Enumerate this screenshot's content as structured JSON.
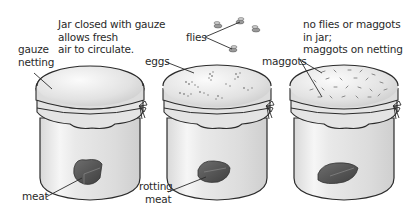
{
  "diagram": {
    "jars": [
      {
        "id": "jar-1",
        "condition": "closed with gauze, fresh meat",
        "description": [
          "Jar closed with gauze",
          "allows fresh",
          "air to circulate."
        ],
        "labels": {
          "lid": [
            "gauze",
            "netting"
          ],
          "contents": [
            "meat"
          ]
        }
      },
      {
        "id": "jar-2",
        "condition": "eggs on gauze, rotting meat",
        "labels": {
          "lid": [
            "eggs"
          ],
          "outside": [
            "flies"
          ],
          "contents": [
            "rotting",
            "meat"
          ]
        }
      },
      {
        "id": "jar-3",
        "condition": "maggots on netting",
        "description": [
          "no flies or maggots",
          "in jar;",
          "maggots on netting"
        ],
        "labels": {
          "lid": [
            "maggots"
          ]
        }
      }
    ],
    "colors": {
      "outline": "#2b2b2b",
      "glass": "#eeeeee",
      "gauze": "#e6e6e6",
      "meat": "#5a5a5a",
      "label_text": "#2a2a2a"
    }
  }
}
